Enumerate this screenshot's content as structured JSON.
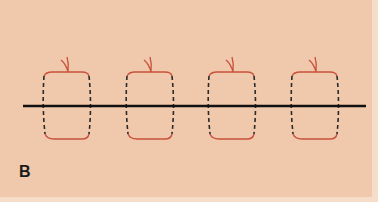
{
  "figure": {
    "panel_label": "B",
    "background_color": "#f0c8ab",
    "line_color": "#111111",
    "suture_color": "#c8523d",
    "dash_color": "#2b2b2b",
    "horizontal_line": {
      "x1": 23,
      "x2": 366,
      "y": 106
    },
    "loops": [
      {
        "index": 1,
        "x_left": 44,
        "x_right": 90
      },
      {
        "index": 2,
        "x_left": 127,
        "x_right": 173
      },
      {
        "index": 3,
        "x_left": 209,
        "x_right": 255
      },
      {
        "index": 4,
        "x_left": 292,
        "x_right": 338
      }
    ],
    "loop_top_y": 72,
    "loop_bottom_y": 139,
    "knot_tip_y": 57
  }
}
